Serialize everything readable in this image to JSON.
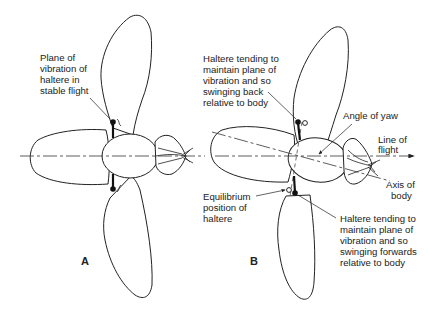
{
  "figure": {
    "panels": [
      {
        "id": "A",
        "label": "A",
        "annotations": [
          {
            "key": "plane",
            "lines": [
              "Plane of",
              "vibration of",
              "haltere in",
              "stable flight"
            ]
          }
        ]
      },
      {
        "id": "B",
        "label": "B",
        "annotations": [
          {
            "key": "back",
            "lines": [
              "Haltere tending to",
              "maintain plane of",
              "vibration and so",
              "swinging back",
              "relative to body"
            ]
          },
          {
            "key": "yaw",
            "lines": [
              "Angle of yaw"
            ]
          },
          {
            "key": "flight",
            "lines": [
              "Line of",
              "flight"
            ]
          },
          {
            "key": "axis",
            "lines": [
              "Axis of",
              "body"
            ]
          },
          {
            "key": "equilibrium",
            "lines": [
              "Equilibrium",
              "position of",
              "haltere"
            ]
          },
          {
            "key": "forwards",
            "lines": [
              "Haltere tending to",
              "maintain plane of",
              "vibration and so",
              "swinging forwards",
              "relative to body"
            ]
          }
        ]
      }
    ]
  }
}
